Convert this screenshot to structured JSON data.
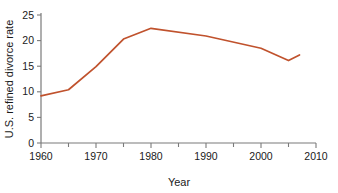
{
  "chart_data": {
    "type": "line",
    "title": "",
    "subtitle": "",
    "xlabel": "Year",
    "ylabel": "U.S. refined divorce rate",
    "xlim": [
      1960,
      2010
    ],
    "ylim": [
      0,
      25
    ],
    "grid": false,
    "legend": null,
    "legend_position": "none",
    "x_major_ticks": [
      1960,
      1970,
      1980,
      1990,
      2000,
      2010
    ],
    "x_major_tick_labels": [
      "1960",
      "1970",
      "1980",
      "1990",
      "2000",
      "2010"
    ],
    "x_minor_ticks": [
      1965,
      1975,
      1985,
      1995,
      2005
    ],
    "y_ticks": [
      0,
      5,
      10,
      15,
      20,
      25
    ],
    "y_tick_labels": [
      "0",
      "5",
      "10",
      "15",
      "20",
      "25"
    ],
    "line_color": "#c0522d",
    "axis_color": "#7a7a7a",
    "text_color": "#1a1a1a",
    "series": [
      {
        "name": "U.S. refined divorce rate",
        "color": "#c0522d",
        "x": [
          1960,
          1965,
          1970,
          1975,
          1980,
          1990,
          2000,
          2005,
          2007
        ],
        "values": [
          9.2,
          10.4,
          14.9,
          20.3,
          22.4,
          20.9,
          18.5,
          16.1,
          17.2
        ]
      }
    ]
  }
}
